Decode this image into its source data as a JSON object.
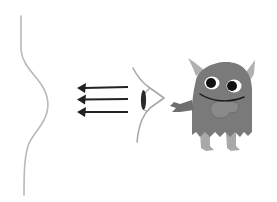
{
  "illustration": {
    "description": "Cartoon monster looking via an eye; three arrows point leftward from the eye toward a curved wavy line",
    "elements": {
      "wave_line": {
        "label": "curved line",
        "color": "#b9b9b9"
      },
      "arrows": {
        "label": "three left-pointing arrows",
        "count": 3,
        "color": "#222222"
      },
      "eye": {
        "label": "side-view eye",
        "outline_color": "#a8a8a8",
        "pupil_color": "#2a2a2a"
      },
      "monster": {
        "label": "grey furry monster with horns",
        "body_color": "#7a7a7a",
        "horn_color": "#b0b0b0",
        "eye_white": "#ffffff",
        "pupil_color": "#111111",
        "leg_color": "#a9a9a9"
      }
    }
  }
}
